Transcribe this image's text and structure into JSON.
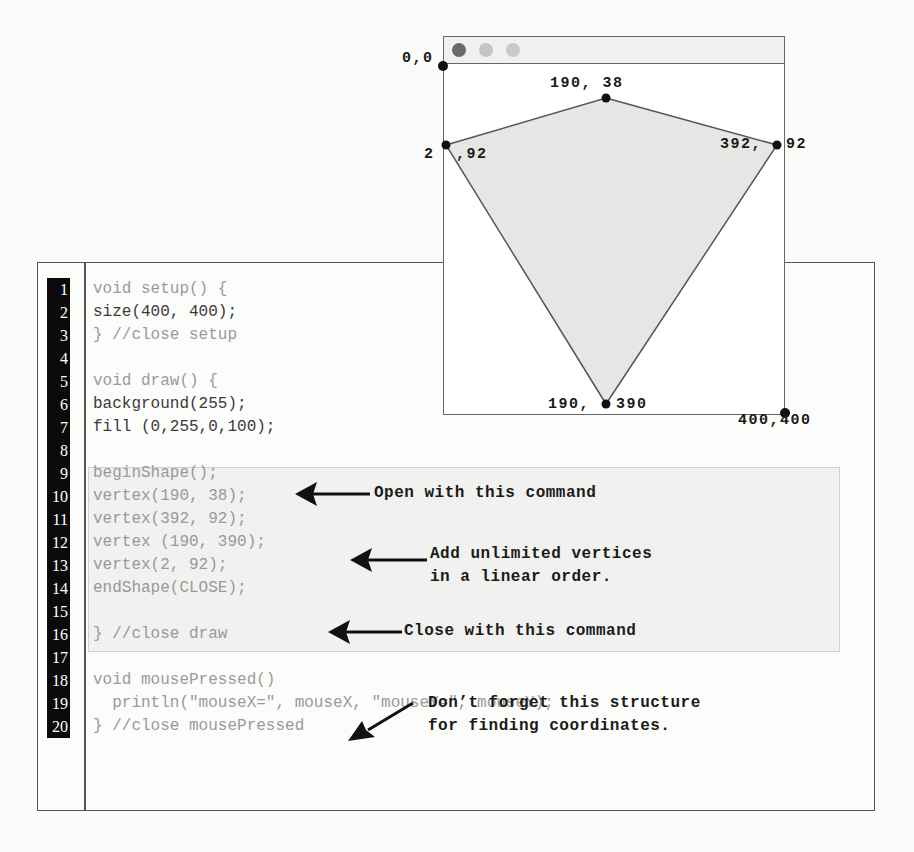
{
  "sketch_window": {
    "title_dots": [
      {
        "name": "close",
        "color": "#6b6b6b"
      },
      {
        "name": "minimize",
        "color": "#c4c4c4"
      },
      {
        "name": "maximize",
        "color": "#c9c9c9"
      }
    ],
    "shape_fill": "#e6e6e4",
    "vertices": [
      {
        "label": "190, 38",
        "x": 190,
        "y": 38
      },
      {
        "label": "392, 92",
        "x": 392,
        "y": 92
      },
      {
        "label": "190, 390",
        "x": 190,
        "y": 390
      },
      {
        "label": "2, 92",
        "x": 2,
        "y": 92
      }
    ],
    "corner_labels": {
      "origin": "0,0",
      "bottom_right": "400,400"
    },
    "vertex_labels": {
      "top": "190, 38",
      "right_a": "392,",
      "right_b": "92",
      "bottom_a": "190,",
      "bottom_b": "390",
      "left_a": "2",
      "left_b": ",92"
    }
  },
  "code": {
    "line_numbers": [
      "1",
      "2",
      "3",
      "4",
      "5",
      "6",
      "7",
      "8",
      "9",
      "10",
      "11",
      "12",
      "13",
      "14",
      "15",
      "16",
      "17",
      "18",
      "19",
      "20"
    ],
    "lines": [
      "void setup() {",
      "size(400, 400);",
      "} //close setup",
      "",
      "void draw() {",
      "background(255);",
      "fill (0,255,0,100);",
      "",
      "beginShape();",
      "vertex(190, 38);",
      "vertex(392, 92);",
      "vertex (190, 390);",
      "vertex(2, 92);",
      "endShape(CLOSE);",
      "",
      "} //close draw",
      "",
      "void mousePressed()",
      "  println(\"mouseX=\", mouseX, \"mouseY=\", mouseY);",
      "} //close mousePressed"
    ]
  },
  "annotations": {
    "open": "Open with this command",
    "add_line1": "Add unlimited vertices",
    "add_line2": "in a linear order.",
    "close": "Close with this command",
    "dont_line1": "Don’t forget this structure",
    "dont_line2": "for finding coordinates."
  }
}
